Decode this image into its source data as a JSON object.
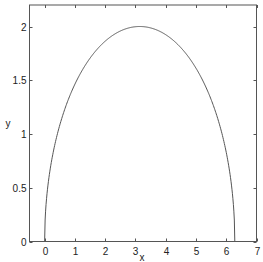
{
  "chart_data": {
    "type": "line",
    "title": "",
    "xlabel": "x",
    "ylabel": "y",
    "xlim": [
      -0.5,
      7
    ],
    "ylim": [
      0,
      2.2
    ],
    "x_ticks": [
      0,
      1,
      2,
      3,
      4,
      5,
      6,
      7
    ],
    "x_tick_labels": [
      "0",
      "1",
      "2",
      "3",
      "4",
      "5",
      "6",
      "7"
    ],
    "y_ticks": [
      0,
      0.5,
      1,
      1.5,
      2
    ],
    "y_tick_labels": [
      "0",
      "0.5",
      "1",
      "1.5",
      "2"
    ],
    "grid": false,
    "legend": null,
    "series": [
      {
        "name": "curve",
        "description": "upper half-ellipse centered at (pi, 0), semi-axes pi and 2: y = 2*sqrt(1-((x-pi)/pi)^2)",
        "x": [
          0,
          0.1,
          0.25,
          0.5,
          0.75,
          1.0,
          1.5,
          2.0,
          2.5,
          3.0,
          3.1416,
          3.5,
          4.0,
          4.5,
          5.0,
          5.5,
          5.75,
          6.0,
          6.2,
          6.2832
        ],
        "values": [
          0,
          0.5,
          0.78,
          1.09,
          1.31,
          1.48,
          1.73,
          1.88,
          1.97,
          2.0,
          2.0,
          1.99,
          1.96,
          1.89,
          1.77,
          1.59,
          1.45,
          1.27,
          0.98,
          0
        ]
      }
    ],
    "colors": {
      "line": "#555555",
      "axes": "#555555",
      "background": "#ffffff"
    }
  }
}
